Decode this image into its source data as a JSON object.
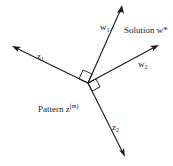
{
  "diagram": {
    "vectors": [
      {
        "id": "w1",
        "label": "w",
        "subscript": "1"
      },
      {
        "id": "w2",
        "label": "w",
        "subscript": "2"
      },
      {
        "id": "z1",
        "label": "z",
        "subscript": "1"
      },
      {
        "id": "z2",
        "label": "z",
        "subscript": "2"
      }
    ],
    "solution_label": "Solution w*",
    "pattern_label": "Pattern z",
    "pattern_superscript": "(m)",
    "right_angle_markers": [
      "w1 ⊥ z1",
      "w2 ⊥ z2"
    ],
    "colors": {
      "ink": "#1a1a1a",
      "background": "#ffffff"
    }
  }
}
